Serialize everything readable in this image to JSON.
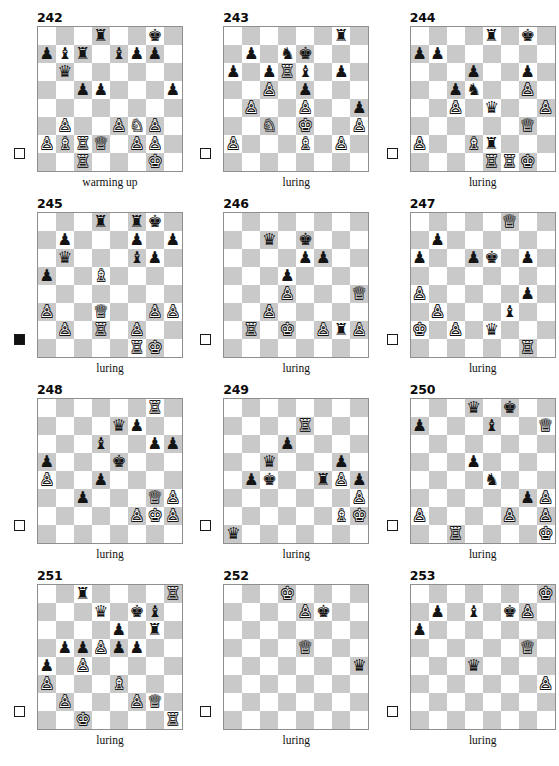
{
  "page": {
    "top_artifact": "",
    "piece_glyphs": {
      "K": "♔",
      "Q": "♕",
      "R": "♖",
      "B": "♗",
      "N": "♘",
      "P": "♙",
      "k": "♚",
      "q": "♛",
      "r": "♜",
      "b": "♝",
      "n": "♞",
      "p": "♟"
    },
    "colors": {
      "light_square": "#ffffff",
      "dark_square": "#c9c9c9",
      "board_border": "#8f8f8f",
      "text": "#111111",
      "piece_white_fill": "#ffffff",
      "piece_white_outline": "#161616",
      "piece_black": "#141414"
    }
  },
  "puzzles": [
    {
      "number": "242",
      "caption": "warming up",
      "to_move": "white",
      "turn_marker": "white-square",
      "board": [
        [
          "",
          "",
          "",
          "r",
          "",
          "",
          "k",
          ""
        ],
        [
          "p",
          "b",
          "r",
          "",
          "b",
          "p",
          "p",
          ""
        ],
        [
          "",
          "q",
          "",
          "",
          "",
          "",
          "",
          ""
        ],
        [
          "",
          "",
          "p",
          "p",
          "",
          "",
          "",
          "p"
        ],
        [
          "",
          "",
          "",
          "",
          "",
          "",
          "",
          ""
        ],
        [
          "",
          "P",
          "",
          "",
          "P",
          "N",
          "P",
          ""
        ],
        [
          "P",
          "B",
          "R",
          "Q",
          "",
          "P",
          "P",
          ""
        ],
        [
          "",
          "",
          "R",
          "",
          "",
          "",
          "K",
          ""
        ]
      ]
    },
    {
      "number": "243",
      "caption": "luring",
      "to_move": "white",
      "turn_marker": "white-square",
      "board": [
        [
          "",
          "",
          "",
          "",
          "",
          "",
          "r",
          ""
        ],
        [
          "",
          "p",
          "",
          "n",
          "k",
          "",
          "",
          ""
        ],
        [
          "p",
          "",
          "p",
          "R",
          "b",
          "",
          "p",
          ""
        ],
        [
          "",
          "",
          "P",
          "",
          "p",
          "",
          "",
          ""
        ],
        [
          "",
          "P",
          "",
          "",
          "P",
          "",
          "",
          "p"
        ],
        [
          "",
          "",
          "N",
          "",
          "K",
          "",
          "",
          "P"
        ],
        [
          "P",
          "",
          "",
          "",
          "B",
          "",
          "P",
          ""
        ],
        [
          "",
          "",
          "",
          "",
          "",
          "",
          "",
          ""
        ]
      ]
    },
    {
      "number": "244",
      "caption": "luring",
      "to_move": "white",
      "turn_marker": "white-square",
      "board": [
        [
          "",
          "",
          "",
          "",
          "r",
          "",
          "k",
          ""
        ],
        [
          "p",
          "p",
          "",
          "",
          "",
          "",
          "",
          ""
        ],
        [
          "",
          "",
          "",
          "p",
          "",
          "",
          "p",
          ""
        ],
        [
          "",
          "",
          "p",
          "n",
          "",
          "",
          "P",
          ""
        ],
        [
          "",
          "",
          "P",
          "",
          "q",
          "",
          "",
          "P"
        ],
        [
          "",
          "",
          "",
          "",
          "",
          "",
          "Q",
          ""
        ],
        [
          "P",
          "",
          "",
          "B",
          "r",
          "",
          "",
          ""
        ],
        [
          "",
          "",
          "",
          "",
          "R",
          "R",
          "K",
          ""
        ]
      ]
    },
    {
      "number": "245",
      "caption": "luring",
      "to_move": "black",
      "turn_marker": "black-square",
      "board": [
        [
          "",
          "",
          "",
          "r",
          "",
          "r",
          "k",
          ""
        ],
        [
          "",
          "p",
          "",
          "",
          "",
          "p",
          "",
          "p"
        ],
        [
          "",
          "q",
          "",
          "",
          "",
          "b",
          "p",
          ""
        ],
        [
          "p",
          "",
          "",
          "B",
          "",
          "",
          "",
          ""
        ],
        [
          "",
          "",
          "",
          "",
          "",
          "",
          "",
          ""
        ],
        [
          "P",
          "",
          "",
          "Q",
          "",
          "",
          "P",
          "P"
        ],
        [
          "",
          "P",
          "",
          "R",
          "",
          "P",
          "",
          ""
        ],
        [
          "",
          "",
          "",
          "",
          "",
          "R",
          "K",
          ""
        ]
      ]
    },
    {
      "number": "246",
      "caption": "luring",
      "to_move": "white",
      "turn_marker": "white-square",
      "board": [
        [
          "",
          "",
          "",
          "",
          "",
          "",
          "",
          ""
        ],
        [
          "",
          "",
          "q",
          "",
          "k",
          "",
          "",
          ""
        ],
        [
          "",
          "",
          "",
          "",
          "p",
          "p",
          "",
          ""
        ],
        [
          "",
          "",
          "",
          "p",
          "",
          "",
          "",
          ""
        ],
        [
          "",
          "",
          "",
          "P",
          "",
          "",
          "",
          "Q"
        ],
        [
          "",
          "",
          "P",
          "",
          "",
          "",
          "",
          ""
        ],
        [
          "",
          "R",
          "",
          "K",
          "",
          "P",
          "r",
          "P"
        ],
        [
          "",
          "",
          "",
          "",
          "",
          "",
          "",
          ""
        ]
      ]
    },
    {
      "number": "247",
      "caption": "luring",
      "to_move": "white",
      "turn_marker": "white-square",
      "board": [
        [
          "",
          "",
          "",
          "",
          "",
          "Q",
          "",
          ""
        ],
        [
          "",
          "p",
          "",
          "",
          "",
          "",
          "",
          ""
        ],
        [
          "p",
          "",
          "",
          "p",
          "k",
          "",
          "p",
          ""
        ],
        [
          "",
          "",
          "",
          "",
          "",
          "",
          "",
          ""
        ],
        [
          "P",
          "",
          "",
          "",
          "",
          "",
          "p",
          ""
        ],
        [
          "",
          "P",
          "",
          "",
          "",
          "b",
          "",
          ""
        ],
        [
          "K",
          "",
          "P",
          "",
          "q",
          "",
          "",
          ""
        ],
        [
          "",
          "",
          "",
          "",
          "",
          "",
          "R",
          ""
        ]
      ]
    },
    {
      "number": "248",
      "caption": "luring",
      "to_move": "white",
      "turn_marker": "white-square",
      "board": [
        [
          "",
          "",
          "",
          "",
          "",
          "",
          "R",
          ""
        ],
        [
          "",
          "",
          "",
          "",
          "q",
          "p",
          "",
          ""
        ],
        [
          "",
          "",
          "",
          "b",
          "",
          "",
          "p",
          "p"
        ],
        [
          "p",
          "",
          "",
          "",
          "k",
          "",
          "",
          ""
        ],
        [
          "P",
          "",
          "",
          "p",
          "",
          "",
          "",
          ""
        ],
        [
          "",
          "",
          "p",
          "",
          "",
          "",
          "Q",
          "P"
        ],
        [
          "",
          "",
          "",
          "",
          "",
          "P",
          "K",
          "P"
        ],
        [
          "",
          "",
          "",
          "",
          "",
          "",
          "",
          ""
        ]
      ]
    },
    {
      "number": "249",
      "caption": "luring",
      "to_move": "white",
      "turn_marker": "white-square",
      "board": [
        [
          "",
          "",
          "",
          "",
          "",
          "",
          "",
          ""
        ],
        [
          "",
          "",
          "",
          "",
          "R",
          "",
          "",
          ""
        ],
        [
          "",
          "",
          "",
          "p",
          "",
          "",
          "",
          ""
        ],
        [
          "",
          "",
          "q",
          "",
          "",
          "",
          "p",
          ""
        ],
        [
          "",
          "p",
          "k",
          "",
          "",
          "r",
          "P",
          "p"
        ],
        [
          "",
          "",
          "",
          "",
          "",
          "",
          "",
          "P"
        ],
        [
          "",
          "",
          "",
          "",
          "",
          "",
          "B",
          "K"
        ],
        [
          "q",
          "",
          "",
          "",
          "",
          "",
          "",
          ""
        ]
      ]
    },
    {
      "number": "250",
      "caption": "luring",
      "to_move": "white",
      "turn_marker": "white-square",
      "board": [
        [
          "",
          "",
          "",
          "q",
          "",
          "k",
          "",
          ""
        ],
        [
          "p",
          "",
          "",
          "",
          "b",
          "",
          "",
          "Q"
        ],
        [
          "",
          "",
          "",
          "",
          "",
          "",
          "",
          ""
        ],
        [
          "",
          "",
          "",
          "p",
          "",
          "",
          "",
          ""
        ],
        [
          "",
          "",
          "",
          "",
          "n",
          "",
          "",
          ""
        ],
        [
          "",
          "",
          "",
          "",
          "",
          "",
          "p",
          "P"
        ],
        [
          "P",
          "",
          "",
          "",
          "",
          "P",
          "",
          "P"
        ],
        [
          "",
          "",
          "R",
          "",
          "",
          "",
          "",
          "K"
        ]
      ]
    },
    {
      "number": "251",
      "caption": "luring",
      "to_move": "white",
      "turn_marker": "white-square",
      "board": [
        [
          "",
          "",
          "r",
          "",
          "",
          "",
          "",
          "R"
        ],
        [
          "",
          "",
          "",
          "q",
          "",
          "k",
          "b",
          ""
        ],
        [
          "",
          "",
          "",
          "",
          "p",
          "",
          "r",
          ""
        ],
        [
          "",
          "p",
          "p",
          "P",
          "p",
          "p",
          "",
          ""
        ],
        [
          "p",
          "",
          "P",
          "",
          "",
          "",
          "",
          ""
        ],
        [
          "P",
          "",
          "",
          "",
          "B",
          "",
          "",
          ""
        ],
        [
          "",
          "P",
          "",
          "",
          "",
          "P",
          "Q",
          ""
        ],
        [
          "",
          "",
          "K",
          "",
          "",
          "",
          "",
          "R"
        ]
      ]
    },
    {
      "number": "252",
      "caption": "luring",
      "to_move": "white",
      "turn_marker": "white-square",
      "board": [
        [
          "",
          "",
          "",
          "K",
          "",
          "",
          "",
          ""
        ],
        [
          "",
          "",
          "",
          "",
          "P",
          "k",
          "",
          ""
        ],
        [
          "",
          "",
          "",
          "",
          "",
          "",
          "",
          ""
        ],
        [
          "",
          "",
          "",
          "",
          "Q",
          "",
          "",
          ""
        ],
        [
          "",
          "",
          "",
          "",
          "",
          "",
          "",
          "q"
        ],
        [
          "",
          "",
          "",
          "",
          "",
          "",
          "",
          ""
        ],
        [
          "",
          "",
          "",
          "",
          "",
          "",
          "",
          ""
        ],
        [
          "",
          "",
          "",
          "",
          "",
          "",
          "",
          ""
        ]
      ]
    },
    {
      "number": "253",
      "caption": "luring",
      "to_move": "white",
      "turn_marker": "white-square",
      "board": [
        [
          "",
          "",
          "",
          "",
          "",
          "",
          "",
          "K"
        ],
        [
          "",
          "p",
          "",
          "b",
          "",
          "k",
          "P",
          ""
        ],
        [
          "p",
          "",
          "",
          "",
          "",
          "",
          "",
          ""
        ],
        [
          "",
          "",
          "",
          "",
          "",
          "",
          "Q",
          ""
        ],
        [
          "",
          "",
          "",
          "q",
          "",
          "",
          "",
          ""
        ],
        [
          "",
          "",
          "",
          "",
          "",
          "",
          "",
          "P"
        ],
        [
          "",
          "",
          "",
          "",
          "",
          "",
          "",
          ""
        ],
        [
          "",
          "",
          "",
          "",
          "",
          "",
          "",
          ""
        ]
      ]
    }
  ]
}
